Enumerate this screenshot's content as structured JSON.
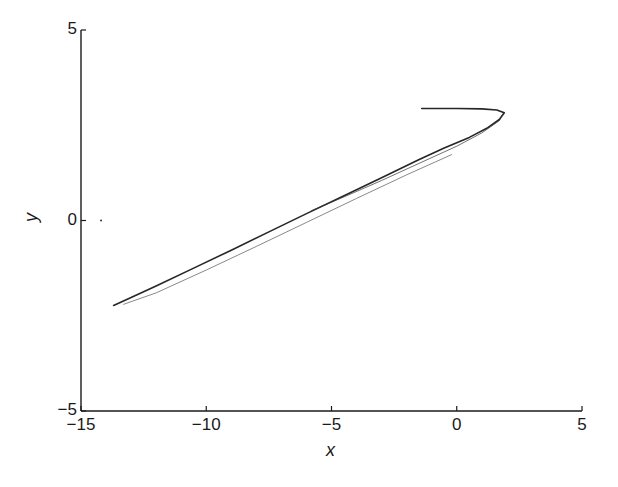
{
  "chart_data": {
    "type": "line",
    "title": "",
    "xlabel": "x",
    "ylabel": "y",
    "xlim": [
      -15,
      5
    ],
    "ylim": [
      -5,
      5
    ],
    "xticks": [
      -15,
      -10,
      -5,
      0,
      5
    ],
    "yticks": [
      -5,
      0,
      5
    ],
    "xtick_labels": [
      "−15",
      "−10",
      "−5",
      "0",
      "5"
    ],
    "ytick_labels": [
      "−5",
      "0",
      "5"
    ],
    "grid": false,
    "legend": null,
    "series": [
      {
        "name": "trajectory",
        "color": "#1a1a1a",
        "points": [
          [
            -1.4,
            2.94
          ],
          [
            0.0,
            2.94
          ],
          [
            1.0,
            2.93
          ],
          [
            1.6,
            2.9
          ],
          [
            1.9,
            2.83
          ],
          [
            1.7,
            2.65
          ],
          [
            1.2,
            2.42
          ],
          [
            0.5,
            2.18
          ],
          [
            -0.5,
            1.9
          ],
          [
            -1.5,
            1.6
          ],
          [
            -3.0,
            1.12
          ],
          [
            -4.5,
            0.65
          ],
          [
            -6.0,
            0.18
          ],
          [
            -7.5,
            -0.3
          ],
          [
            -9.0,
            -0.78
          ],
          [
            -10.5,
            -1.25
          ],
          [
            -12.0,
            -1.72
          ],
          [
            -13.0,
            -2.02
          ],
          [
            -13.7,
            -2.23
          ]
        ]
      },
      {
        "name": "trajectory-inner",
        "color": "#333333",
        "points": [
          [
            -5.8,
            0.26
          ],
          [
            -4.5,
            0.62
          ],
          [
            -3.0,
            1.05
          ],
          [
            -1.5,
            1.5
          ],
          [
            0.0,
            1.95
          ],
          [
            1.0,
            2.3
          ],
          [
            1.7,
            2.62
          ],
          [
            1.85,
            2.8
          ]
        ]
      },
      {
        "name": "trajectory-lower-branch",
        "color": "#555555",
        "points": [
          [
            -0.2,
            1.73
          ],
          [
            -2.0,
            1.2
          ],
          [
            -4.0,
            0.58
          ],
          [
            -6.0,
            -0.05
          ],
          [
            -8.0,
            -0.68
          ],
          [
            -10.0,
            -1.3
          ],
          [
            -12.0,
            -1.9
          ],
          [
            -13.3,
            -2.2
          ]
        ]
      }
    ],
    "annotations": [
      {
        "type": "point",
        "x": -14.2,
        "y": 0.0
      }
    ]
  }
}
